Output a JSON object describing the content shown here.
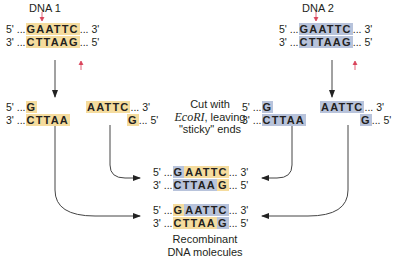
{
  "colors": {
    "dna1_highlight": "#f5dc9e",
    "dna2_highlight": "#b8c3db",
    "cut_marker": "#d9435a",
    "arrow": "#333333"
  },
  "dna1": {
    "label": "DNA 1",
    "top": {
      "prefix": "5' ...",
      "site": "GAATTC",
      "suffix": "... 3'"
    },
    "bottom": {
      "prefix": "3' ...",
      "site": "CTTAAG",
      "suffix": "... 5'"
    }
  },
  "dna2": {
    "label": "DNA 2",
    "top": {
      "prefix": "5' ...",
      "site": "GAATTC",
      "suffix": "... 3'"
    },
    "bottom": {
      "prefix": "3' ...",
      "site": "CTTAAG",
      "suffix": "... 5'"
    }
  },
  "cut_fragments": {
    "dna1_left": {
      "top_prefix": "5' ...",
      "top": "G",
      "bottom_prefix": "3' ...",
      "bottom": "CTTAA"
    },
    "dna1_right": {
      "top": "AATTC",
      "top_suffix": "... 3'",
      "bottom": "G",
      "bottom_suffix": "... 5'"
    },
    "dna2_left": {
      "top_prefix": "5' ...",
      "top": "G",
      "bottom_prefix": "3' ...",
      "bottom": "CTTAA"
    },
    "dna2_right": {
      "top": "AATTC",
      "top_suffix": "... 3'",
      "bottom": "G",
      "bottom_suffix": "... 5'"
    }
  },
  "cut_caption": {
    "line1": "Cut with",
    "enzyme": "EcoRI",
    "line2_rest": ", leaving",
    "line3": "\"sticky\" ends"
  },
  "recombinant_1": {
    "top": {
      "prefix": "5' ...",
      "a": "G",
      "b": "AATTC",
      "suffix": "... 3'"
    },
    "bottom": {
      "prefix": "3' ...",
      "a": "CTTAA",
      "b": "G",
      "suffix": "... 5'"
    }
  },
  "recombinant_2": {
    "top": {
      "prefix": "5' ...",
      "a": "G",
      "b": "AATTC",
      "suffix": "... 3'"
    },
    "bottom": {
      "prefix": "3' ...",
      "a": "CTTAA",
      "b": "G",
      "suffix": "... 5'"
    }
  },
  "recombinant_caption": {
    "line1": "Recombinant",
    "line2": "DNA molecules"
  }
}
